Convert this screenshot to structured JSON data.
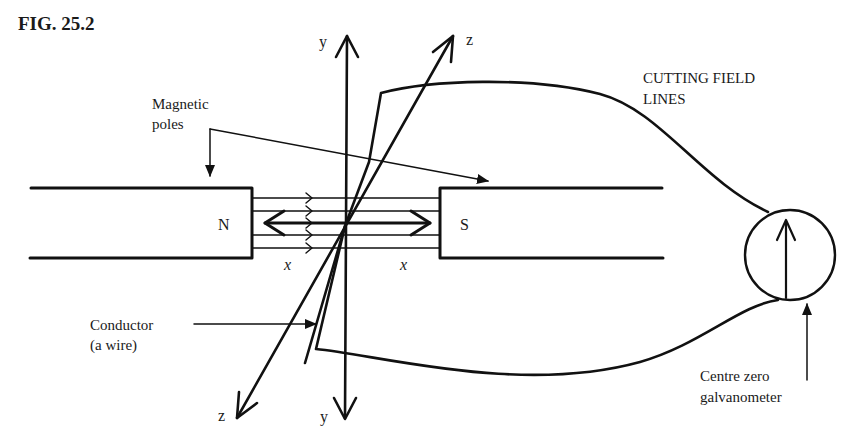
{
  "figure": {
    "title": "FIG. 25.2",
    "labels": {
      "magnetic_poles_line1": "Magnetic",
      "magnetic_poles_line2": "poles",
      "cutting_line1": "CUTTING FIELD",
      "cutting_line2": "LINES",
      "conductor_line1": "Conductor",
      "conductor_line2": "(a wire)",
      "galvanometer_line1": "Centre zero",
      "galvanometer_line2": "galvanometer"
    },
    "poles": {
      "north": "N",
      "south": "S"
    },
    "axes": {
      "y_top": "y",
      "y_bottom": "y",
      "z_top": "z",
      "z_bottom": "z",
      "x_left": "x",
      "x_right": "x"
    },
    "field_line_count": 5,
    "colors": {
      "ink": "#111111",
      "paper": "#ffffff"
    }
  }
}
